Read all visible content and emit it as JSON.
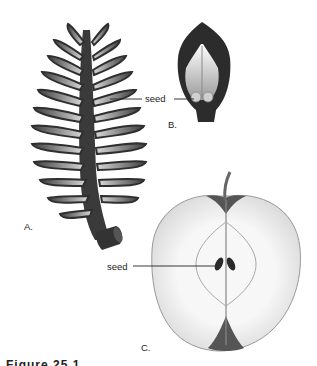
{
  "figure": {
    "caption_fragment": "Figure 25.1",
    "panels": [
      {
        "id": "A",
        "label": "A.",
        "subject": "pine-cone-section",
        "pointer_label": "seed"
      },
      {
        "id": "B",
        "label": "B.",
        "subject": "cone-scale-with-seeds",
        "pointer_label": "seed"
      },
      {
        "id": "C",
        "label": "C.",
        "subject": "apple-cross-section",
        "pointer_label": "seed"
      }
    ]
  },
  "colors": {
    "background": "#ffffff",
    "cone_dark": "#3a3a3a",
    "cone_light": "#bdbdbd",
    "apple_flesh": "#f2f2f2",
    "apple_skin": "#555555",
    "seed": "#2a2a2a",
    "text": "#222222"
  }
}
